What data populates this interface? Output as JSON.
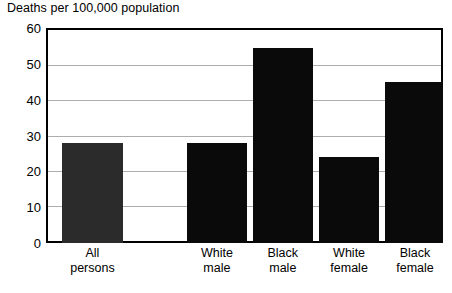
{
  "chart_data": {
    "type": "bar",
    "title": "Deaths per 100,000 population",
    "xlabel": "",
    "ylabel": "Deaths per 100,000 population",
    "ylim": [
      0,
      60
    ],
    "yticks": [
      0,
      10,
      20,
      30,
      40,
      50,
      60
    ],
    "ytick_labels": [
      "0",
      "10",
      "20",
      "30",
      "40",
      "50",
      "60"
    ],
    "grid": true,
    "gridlines_at": [
      10,
      20,
      30,
      40,
      50
    ],
    "legend": false,
    "categories": [
      "All persons",
      "White male",
      "Black male",
      "White female",
      "Black female"
    ],
    "category_lines": [
      [
        "All",
        "persons"
      ],
      [
        "White",
        "male"
      ],
      [
        "Black",
        "male"
      ],
      [
        "White",
        "female"
      ],
      [
        "Black",
        "female"
      ]
    ],
    "values": [
      28,
      28,
      54.5,
      24,
      45
    ],
    "bar_colors": [
      "#2b2b2b",
      "#0a0a0a",
      "#0a0a0a",
      "#0a0a0a",
      "#0a0a0a"
    ],
    "bar_left_pct": [
      4.0,
      35.5,
      52.1,
      68.8,
      85.4
    ],
    "bar_width_pct": [
      15.4,
      15.1,
      15.1,
      15.1,
      15.1
    ],
    "colors": {
      "background": "#ffffff",
      "axis": "#000000",
      "gridline": "#adadad",
      "text": "#000000",
      "bar_primary": "#0a0a0a",
      "bar_highlight": "#2b2b2b"
    }
  }
}
